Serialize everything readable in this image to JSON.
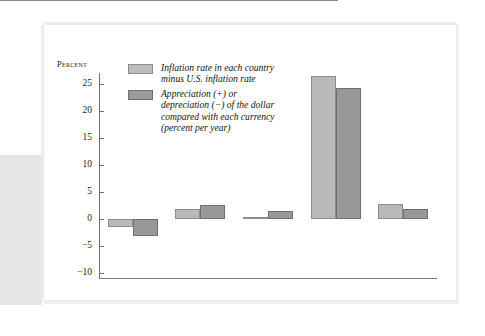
{
  "chart_data": {
    "type": "bar",
    "title": "",
    "subtitle": "",
    "xlabel": "",
    "ylabel": "Percent",
    "ylim": [
      -10,
      27
    ],
    "yticks": [
      -10,
      -5,
      0,
      5,
      10,
      15,
      20,
      25
    ],
    "ytick_labels": [
      "−10",
      "−5",
      "0",
      "5",
      "10",
      "15",
      "20",
      "25"
    ],
    "grid": false,
    "legend_position": "upper-left-inside",
    "categories": [
      "Japan",
      "Australia",
      "Canada",
      "Mexico",
      "U.K."
    ],
    "series": [
      {
        "name": "Inflation rate in each country minus U.S. inflation rate",
        "color": "#b9b9b9",
        "values": [
          -1.4,
          1.8,
          0.3,
          26.3,
          2.7
        ]
      },
      {
        "name": "Appreciation (+) or depreciation (−) of the dollar compared with each currency (percent per year)",
        "color": "#989898",
        "values": [
          -3.2,
          2.6,
          1.5,
          24.1,
          1.8
        ]
      }
    ]
  },
  "axis": {
    "y_title": "Percent",
    "tick_labels": [
      "25",
      "20",
      "15",
      "10",
      "5",
      "0",
      "−5",
      "−10"
    ]
  },
  "legend": {
    "entries": [
      {
        "swatch": "light-gray-swatch",
        "label": "Inflation rate in each country\nminus U.S. inflation rate"
      },
      {
        "swatch": "dark-gray-swatch",
        "label": "Appreciation (+) or\ndepreciation (−) of the dollar\ncompared with each currency\n(percent per year)"
      }
    ]
  },
  "categories": [
    {
      "label": "Japan"
    },
    {
      "label": "Australia"
    },
    {
      "label": "Canada"
    },
    {
      "label": "Mexico"
    },
    {
      "label": "U.K."
    }
  ]
}
